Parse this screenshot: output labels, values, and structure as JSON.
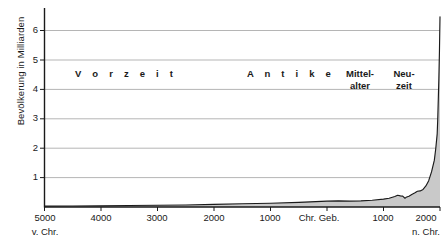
{
  "chart_data": {
    "type": "area",
    "title": "",
    "xlabel": "",
    "ylabel": "Bevölkerung in Milliarden",
    "xlim": [
      -5000,
      2000
    ],
    "ylim": [
      0,
      6.8
    ],
    "grid": true,
    "legend": "none",
    "x_tick_labels": [
      "5000",
      "4000",
      "3000",
      "2000",
      "1000",
      "Chr. Geb.",
      "1000",
      "2000"
    ],
    "x_tick_values": [
      -5000,
      -4000,
      -3000,
      -2000,
      -1000,
      0,
      1000,
      2000
    ],
    "x_axis_start_sublabel": "v. Chr.",
    "x_axis_end_sublabel": "n. Chr.",
    "y_tick_labels": [
      "1",
      "2",
      "3",
      "4",
      "5",
      "6"
    ],
    "y_tick_values": [
      1,
      2,
      3,
      4,
      5,
      6
    ],
    "series_name": "Weltbevölkerung",
    "x": [
      -5000,
      -4500,
      -4000,
      -3500,
      -3000,
      -2500,
      -2000,
      -1500,
      -1000,
      -500,
      0,
      200,
      400,
      600,
      800,
      1000,
      1100,
      1200,
      1250,
      1300,
      1340,
      1380,
      1400,
      1450,
      1500,
      1550,
      1600,
      1650,
      1700,
      1750,
      1800,
      1850,
      1900,
      1925,
      1950,
      1960,
      1970,
      1980,
      1990,
      2000
    ],
    "values": [
      0.03,
      0.035,
      0.04,
      0.05,
      0.06,
      0.07,
      0.09,
      0.11,
      0.13,
      0.16,
      0.2,
      0.21,
      0.2,
      0.21,
      0.23,
      0.27,
      0.3,
      0.36,
      0.4,
      0.38,
      0.37,
      0.3,
      0.33,
      0.37,
      0.43,
      0.48,
      0.54,
      0.55,
      0.6,
      0.72,
      0.9,
      1.2,
      1.6,
      2.0,
      2.5,
      3.0,
      3.7,
      4.4,
      5.3,
      6.5
    ],
    "annotations": [
      {
        "label": "Vorzeit",
        "from": -5000,
        "to": -800,
        "y_level": 4.6
      },
      {
        "label_line1": "Antike",
        "from": -800,
        "to": 500,
        "y_level": 4.6
      },
      {
        "label_line1": "Mittel-",
        "label_line2": "alter",
        "from": 500,
        "to": 1500,
        "y_level": 4.6
      },
      {
        "label_line1": "Neu-",
        "label_line2": "zeit",
        "from": 1500,
        "to": 2000,
        "y_level": 4.6
      }
    ],
    "colors": {
      "area_fill": "#c9c9c9",
      "curve_line": "#1a1a1a",
      "axis": "#1a1a1a",
      "grid": "#b5b5b5",
      "text": "#1a1a1a",
      "background": "#ffffff"
    }
  },
  "axis": {
    "y_label": "Bevölkerung in Milliarden",
    "y_ticks": [
      "6",
      "5",
      "4",
      "3",
      "2",
      "1"
    ],
    "x_ticks": [
      "5000",
      "4000",
      "3000",
      "2000",
      "1000",
      "Chr. Geb.",
      "1000",
      "2000"
    ],
    "x_start_sub": "v. Chr.",
    "x_end_sub": "n. Chr."
  },
  "eras": {
    "vorzeit": "V o r z e i t",
    "antike": "A n t i k e",
    "mittelalter_line1": "Mittel-",
    "mittelalter_line2": "alter",
    "neuzeit_line1": "Neu-",
    "neuzeit_line2": "zeit"
  }
}
